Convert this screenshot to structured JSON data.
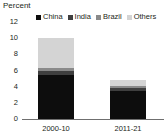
{
  "chart_data": {
    "type": "bar",
    "stacked": true,
    "title": "",
    "subtitle": "",
    "xlabel": "",
    "ylabel": "Percent",
    "ylim": [
      0,
      12
    ],
    "yticks": [
      0,
      2,
      4,
      6,
      8,
      10,
      12
    ],
    "grid": false,
    "legend_position": "top",
    "categories": [
      "2000-10",
      "2011-21"
    ],
    "series": [
      {
        "name": "China",
        "color": "#0d0d0d",
        "values": [
          5.5,
          3.5
        ]
      },
      {
        "name": "India",
        "color": "#3f3f3f",
        "values": [
          0.5,
          0.4
        ]
      },
      {
        "name": "Brazil",
        "color": "#8a8a8a",
        "values": [
          0.3,
          0.2
        ]
      },
      {
        "name": "Others",
        "color": "#d4d4d4",
        "values": [
          3.7,
          0.7
        ]
      }
    ],
    "totals": [
      10.0,
      4.8
    ]
  },
  "axis": {
    "ylabel_text": "Percent",
    "tick_0": "0",
    "tick_1": "2",
    "tick_2": "4",
    "tick_3": "6",
    "tick_4": "8",
    "tick_5": "10",
    "tick_6": "12"
  },
  "legend": {
    "items": [
      {
        "label": "China",
        "color": "#0d0d0d",
        "swatch": "square-marker-icon"
      },
      {
        "label": "India",
        "color": "#3f3f3f",
        "swatch": "square-marker-icon"
      },
      {
        "label": "Brazil",
        "color": "#8a8a8a",
        "swatch": "square-marker-icon"
      },
      {
        "label": "Others",
        "color": "#d4d4d4",
        "swatch": "square-marker-icon"
      }
    ]
  },
  "colors": {
    "background": "#ffffff",
    "text": "#231f20",
    "axis_line": "#6f6f6f"
  }
}
